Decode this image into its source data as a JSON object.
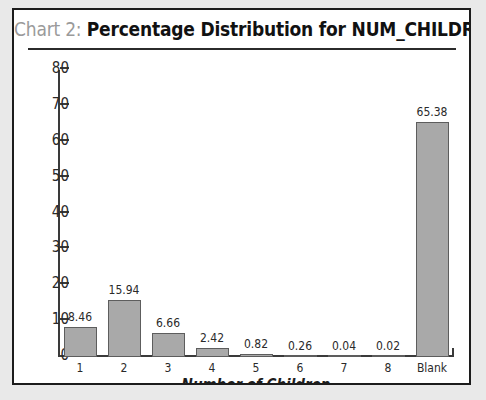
{
  "card": {
    "background": "#ffffff",
    "border_color": "#1c1c1c",
    "page_background": "#e9e9e9"
  },
  "title": {
    "prefix": "Chart 2:",
    "prefix_color": "#9a9a9a",
    "main": "Percentage Distribution for NUM_CHILDREN",
    "main_color": "#111111",
    "full": "Chart 2: Percentage Distribution for NUM_CHILDREN"
  },
  "chart_data": {
    "type": "bar",
    "title": "Chart 2: Percentage Distribution for NUM_CHILDREN",
    "xlabel": "Number of Children",
    "ylabel": "",
    "categories": [
      "1",
      "2",
      "3",
      "4",
      "5",
      "6",
      "7",
      "8",
      "Blank"
    ],
    "values": [
      8.46,
      15.94,
      6.66,
      2.42,
      0.82,
      0.26,
      0.04,
      0.02,
      65.38
    ],
    "value_labels": [
      "8.46",
      "15.94",
      "6.66",
      "2.42",
      "0.82",
      "0.26",
      "0.04",
      "0.02",
      "65.38"
    ],
    "ylim": [
      0,
      80
    ],
    "yticks": [
      0,
      10,
      20,
      30,
      40,
      50,
      60,
      70,
      80
    ],
    "ytick_labels": [
      "0",
      "10",
      "20",
      "30",
      "40",
      "50",
      "60",
      "70",
      "80"
    ],
    "grid": false,
    "legend": null,
    "bar_fill": "#a9a9a9",
    "bar_border": "#5d5d5d",
    "axis_color": "#3a3a3a"
  }
}
